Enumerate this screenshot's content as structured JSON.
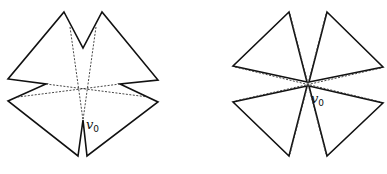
{
  "figures": [
    {
      "id": "left",
      "description": "Non-convex star-shaped polygon with four lobes and notches; dashed diagonals cross, vertex v0 at bottom notch",
      "label": "v",
      "label_sub": "0"
    },
    {
      "id": "right",
      "description": "Four triangles meeting near a central point; dashed lines through center, vertex v0 at center",
      "label": "v",
      "label_sub": "0"
    }
  ],
  "colors": {
    "stroke": "#111111",
    "dashed": "#333333",
    "background": "#ffffff"
  }
}
